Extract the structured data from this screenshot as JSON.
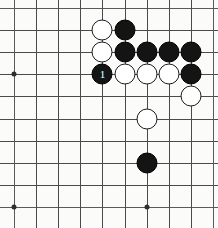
{
  "figure": {
    "board": {
      "columns": 10,
      "rows": 10,
      "origin_x": 14,
      "origin_y": 8,
      "spacing_x": 22.1,
      "spacing_y": 22.1,
      "line_color": "#4a4a4a",
      "background_color": "#fbfbfa"
    },
    "star_points": [
      {
        "name": "star-point-left",
        "col": 0,
        "row": 3
      },
      {
        "name": "star-point-bottom-left",
        "col": 0,
        "row": 9
      },
      {
        "name": "star-point-bottom-center",
        "col": 6,
        "row": 9
      }
    ],
    "stones": [
      {
        "name": "white-stone-c4-r2",
        "color": "white",
        "col": 4,
        "row": 1,
        "label": ""
      },
      {
        "name": "black-stone-c5-r2",
        "color": "black",
        "col": 5,
        "row": 1,
        "label": ""
      },
      {
        "name": "white-stone-c4-r3",
        "color": "white",
        "col": 4,
        "row": 2,
        "label": ""
      },
      {
        "name": "black-stone-c5-r3",
        "color": "black",
        "col": 5,
        "row": 2,
        "label": ""
      },
      {
        "name": "black-stone-c6-r3",
        "color": "black",
        "col": 6,
        "row": 2,
        "label": ""
      },
      {
        "name": "black-stone-c7-r3",
        "color": "black",
        "col": 7,
        "row": 2,
        "label": ""
      },
      {
        "name": "black-stone-c8-r3",
        "color": "black",
        "col": 8,
        "row": 2,
        "label": ""
      },
      {
        "name": "black-stone-move-1",
        "color": "black",
        "col": 4,
        "row": 3,
        "label": "1"
      },
      {
        "name": "white-stone-c5-r4",
        "color": "white",
        "col": 5,
        "row": 3,
        "label": ""
      },
      {
        "name": "white-stone-c6-r4",
        "color": "white",
        "col": 6,
        "row": 3,
        "label": ""
      },
      {
        "name": "white-stone-c7-r4",
        "color": "white",
        "col": 7,
        "row": 3,
        "label": ""
      },
      {
        "name": "black-stone-c8-r4",
        "color": "black",
        "col": 8,
        "row": 3,
        "label": ""
      },
      {
        "name": "white-stone-c8-r5",
        "color": "white",
        "col": 8,
        "row": 4,
        "label": ""
      },
      {
        "name": "white-stone-c6-r6",
        "color": "white",
        "col": 6,
        "row": 5,
        "label": ""
      },
      {
        "name": "black-stone-c6-r8",
        "color": "black",
        "col": 6,
        "row": 7,
        "label": ""
      }
    ],
    "move_labels": {
      "move_one": "1"
    }
  }
}
